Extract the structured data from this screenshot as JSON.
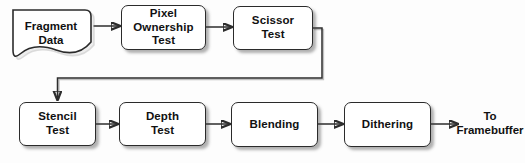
{
  "diagram": {
    "background_color": "#fdfdfd",
    "stroke_color": "#2d2d2d",
    "node_fill": "#ffffff",
    "nodes": [
      {
        "id": "fragment_data",
        "label": "Fragment\nData",
        "shape": "document"
      },
      {
        "id": "pixel_ownership",
        "label": "Pixel\nOwnership\nTest",
        "shape": "rounded-rect"
      },
      {
        "id": "scissor_test",
        "label": "Scissor\nTest",
        "shape": "rounded-rect"
      },
      {
        "id": "stencil_test",
        "label": "Stencil\nTest",
        "shape": "rounded-rect"
      },
      {
        "id": "depth_test",
        "label": "Depth\nTest",
        "shape": "rounded-rect"
      },
      {
        "id": "blending",
        "label": "Blending",
        "shape": "rounded-rect"
      },
      {
        "id": "dithering",
        "label": "Dithering",
        "shape": "rounded-rect"
      }
    ],
    "terminals": [
      {
        "id": "to_framebuffer",
        "label": "To\nFramebuffer"
      }
    ],
    "edges": [
      {
        "from": "fragment_data",
        "to": "pixel_ownership",
        "style": "straight-arrow"
      },
      {
        "from": "pixel_ownership",
        "to": "scissor_test",
        "style": "straight-arrow"
      },
      {
        "from": "scissor_test",
        "to": "stencil_test",
        "style": "elbow-arrow"
      },
      {
        "from": "stencil_test",
        "to": "depth_test",
        "style": "straight-arrow"
      },
      {
        "from": "depth_test",
        "to": "blending",
        "style": "straight-arrow"
      },
      {
        "from": "blending",
        "to": "dithering",
        "style": "straight-arrow"
      },
      {
        "from": "dithering",
        "to": "to_framebuffer",
        "style": "straight-arrow"
      }
    ]
  }
}
